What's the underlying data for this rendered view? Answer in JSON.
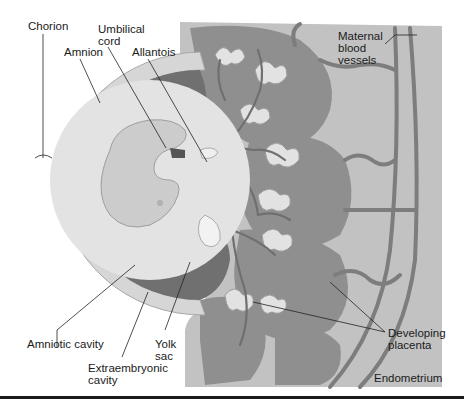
{
  "figure": {
    "colors": {
      "background": "#ffffff",
      "endometrium": "#bdbdbd",
      "placenta_dark": "#8a8a8a",
      "vessel": "#7a7a7a",
      "villi_light": "#e6e6e6",
      "chorion": "#d9d9d9",
      "amnion_band": "#6e6e6e",
      "amniotic_fluid": "#e4e4e4",
      "embryo": "#cfcfcf",
      "leader_line": "#222222",
      "rule": "#1a1a1a"
    }
  },
  "labels": {
    "chorion": "Chorion",
    "umbilical_cord": "Umbilical\ncord",
    "amnion": "Amnion",
    "allantois": "Allantois",
    "maternal_blood_vessels": "Maternal\nblood\nvessels",
    "amniotic_cavity": "Amniotic cavity",
    "extraembryonic_cavity": "Extraembryonic\ncavity",
    "yolk_sac": "Yolk\nsac",
    "developing_placenta": "Developing\nplacenta",
    "endometrium": "Endometrium"
  }
}
